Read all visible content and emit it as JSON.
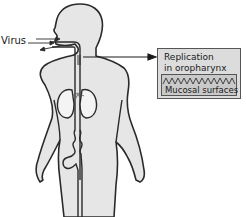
{
  "diagram": {
    "labels": {
      "virus": "Virus",
      "box_title_line1": "Replication",
      "box_title_line2": "in oropharynx",
      "mucosa": "Mucosal surfaces"
    },
    "colors": {
      "body_fill": "#e6e6e6",
      "outline": "#2a2a2a",
      "box_fill": "#dcdcdc",
      "inner_box_fill": "#c9c9c9",
      "text": "#1a1a1a"
    },
    "elements": [
      {
        "name": "human-body-silhouette",
        "kind": "illustration"
      },
      {
        "name": "airway-tube",
        "kind": "illustration"
      },
      {
        "name": "lungs",
        "kind": "illustration"
      },
      {
        "name": "digestive-tract",
        "kind": "illustration"
      },
      {
        "name": "virus-entry-arrows",
        "kind": "arrow"
      },
      {
        "name": "pointer-arrow-to-box",
        "kind": "arrow"
      },
      {
        "name": "replication-box",
        "kind": "callout"
      }
    ]
  }
}
